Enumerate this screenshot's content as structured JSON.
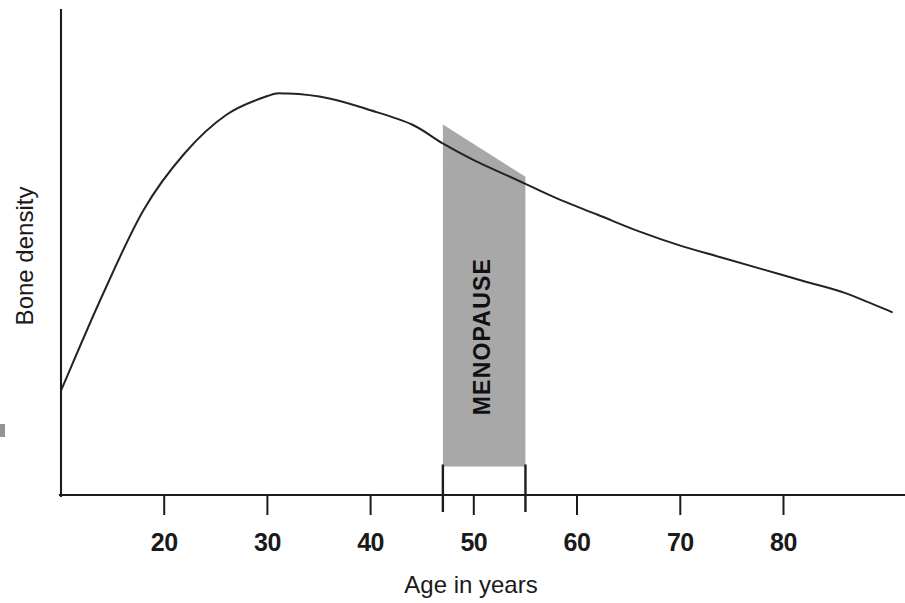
{
  "chart_data": {
    "type": "line",
    "title": "",
    "xlabel": "Age in years",
    "ylabel": "Bone density",
    "xlim": [
      10,
      91
    ],
    "ylim": [
      0,
      1
    ],
    "grid": false,
    "legend": null,
    "xticks": [
      20,
      30,
      40,
      50,
      60,
      70,
      80
    ],
    "xtick_labels": [
      "20",
      "30",
      "40",
      "50",
      "60",
      "70",
      "80"
    ],
    "yticks": [],
    "ytick_labels": [],
    "series": [
      {
        "name": "Bone density",
        "x": [
          10,
          14,
          18,
          22,
          26,
          30,
          32,
          36,
          40,
          44,
          47,
          50,
          55,
          58,
          62,
          66,
          70,
          74,
          78,
          82,
          86,
          90.5
        ],
        "y": [
          0.22,
          0.42,
          0.6,
          0.72,
          0.8,
          0.84,
          0.845,
          0.835,
          0.81,
          0.78,
          0.74,
          0.705,
          0.655,
          0.625,
          0.59,
          0.555,
          0.525,
          0.5,
          0.475,
          0.45,
          0.425,
          0.385
        ]
      }
    ],
    "annotations": [
      {
        "label": "MENOPAUSE",
        "type": "shaded-band",
        "x_start": 47,
        "x_end": 55,
        "y_top_start": 0.78,
        "y_top_end": 0.67,
        "y_bottom": 0.06,
        "fill_color": "#a8a8a8",
        "text_rotation": -90
      }
    ],
    "colors": {
      "curve": "#232323",
      "axis": "#1c1c1c",
      "band_fill": "#a8a8a8",
      "band_edge": "#1c1c1c",
      "background": "#ffffff"
    }
  },
  "axes": {
    "x_title": "Age in years",
    "y_title": "Bone density",
    "tick_labels": [
      "20",
      "30",
      "40",
      "50",
      "60",
      "70",
      "80"
    ]
  },
  "band": {
    "label": "MENOPAUSE"
  }
}
